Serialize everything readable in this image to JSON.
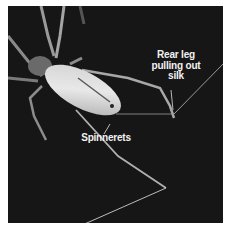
{
  "figure": {
    "background_color": "#161616",
    "labels": [
      {
        "id": "rear-leg",
        "text": "Rear leg\npulling out\nsilk"
      },
      {
        "id": "spinnerets",
        "text": "Spinnerets"
      }
    ]
  }
}
